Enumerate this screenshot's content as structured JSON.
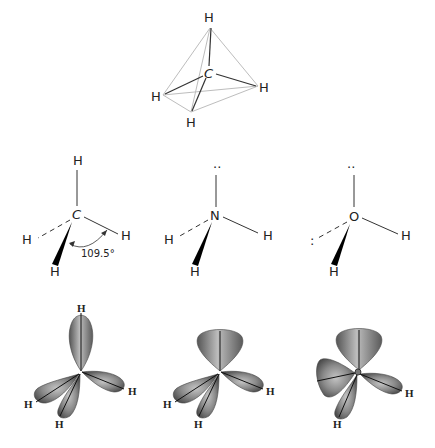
{
  "figure": {
    "tetrahedron": {
      "center": "C",
      "substituents": [
        "H",
        "H",
        "H",
        "H"
      ]
    },
    "structures": [
      {
        "name": "methane",
        "central_atom": "C",
        "top": "H",
        "left": "H",
        "right": "H",
        "bottom": "H",
        "bond_angle": "109.5°"
      },
      {
        "name": "ammonia",
        "central_atom": "N",
        "top": "··",
        "left": "H",
        "right": "H",
        "bottom": "H"
      },
      {
        "name": "water",
        "central_atom": "O",
        "top": "··",
        "left": ":",
        "right": "H",
        "bottom": "H"
      }
    ],
    "orbitals": [
      {
        "name": "methane-orbitals",
        "labels": [
          "H",
          "H",
          "H",
          "H"
        ]
      },
      {
        "name": "ammonia-orbitals",
        "labels": [
          "H",
          "H",
          "H"
        ]
      },
      {
        "name": "water-orbitals",
        "labels": [
          "H",
          "H"
        ]
      }
    ],
    "colors": {
      "lobe_dark": "#555555",
      "lobe_light": "#bdbdbd",
      "tetra_edge": "#bdbdbd",
      "bond": "#333333"
    }
  }
}
